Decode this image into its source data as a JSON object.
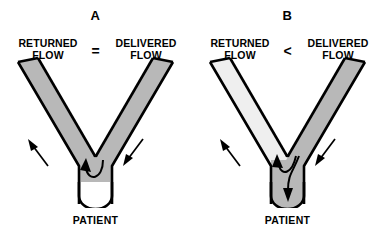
{
  "figure": {
    "background_color": "#ffffff"
  },
  "colors": {
    "tube_outline": "#000000",
    "flow_gray": "#b8b8b8",
    "flow_gray_light": "#efefef",
    "empty_white": "#ffffff",
    "text": "#000000",
    "arrow": "#000000"
  },
  "panels": [
    {
      "id": "a",
      "letter": "A",
      "left_label": "RETURNED\nFLOW",
      "compare_symbol": "=",
      "right_label": "DELIVERED\nFLOW",
      "patient_label": "PATIENT",
      "left_arm_fill": "#b8b8b8",
      "right_arm_fill": "#b8b8b8",
      "stem_fill": "#ffffff",
      "arrows": [
        {
          "name": "outer-left-arrow",
          "direction": "up-left",
          "meaning": "returned flow out"
        },
        {
          "name": "outer-right-arrow",
          "direction": "down-left",
          "meaning": "delivered flow in"
        },
        {
          "name": "junction-recirculation-arrow",
          "direction": "curve-up-left",
          "meaning": "full recirculation at junction"
        }
      ],
      "stem_flow": "none"
    },
    {
      "id": "b",
      "letter": "B",
      "left_label": "RETURNED\nFLOW",
      "compare_symbol": "<",
      "right_label": "DELIVERED\nFLOW",
      "patient_label": "PATIENT",
      "left_arm_fill": "#efefef",
      "right_arm_fill": "#b8b8b8",
      "stem_fill": "#b8b8b8",
      "arrows": [
        {
          "name": "outer-left-arrow",
          "direction": "up-left",
          "meaning": "returned flow out"
        },
        {
          "name": "outer-right-arrow",
          "direction": "down-left",
          "meaning": "delivered flow in"
        },
        {
          "name": "junction-branch-up-arrow",
          "direction": "curve-up-left",
          "meaning": "partial recirculation"
        },
        {
          "name": "junction-branch-down-arrow",
          "direction": "down",
          "meaning": "net flow to patient"
        }
      ],
      "stem_flow": "downward"
    }
  ]
}
